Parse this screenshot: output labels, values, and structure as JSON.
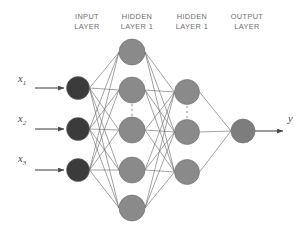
{
  "diagram": {
    "type": "neural-network-architecture",
    "background_color": "#ffffff",
    "layer_titles": [
      {
        "id": "input",
        "text": "INPUT\nLAYER",
        "x": 60,
        "y": 12,
        "width": 54
      },
      {
        "id": "hidden1",
        "text": "HIDDEN\nLAYER 1",
        "x": 108,
        "y": 12,
        "width": 58
      },
      {
        "id": "hidden2",
        "text": "HIDDEN\nLAYER 1",
        "x": 163,
        "y": 12,
        "width": 58
      },
      {
        "id": "output",
        "text": "OUTPUT\nLAYER",
        "x": 218,
        "y": 12,
        "width": 58
      }
    ],
    "input_labels": [
      {
        "base": "x",
        "sub": "1",
        "x": 18,
        "y": 80
      },
      {
        "base": "x",
        "sub": "2",
        "x": 18,
        "y": 120
      },
      {
        "base": "x",
        "sub": "3",
        "x": 18,
        "y": 160
      }
    ],
    "output_label": {
      "base": "y",
      "sub": "",
      "x": 288,
      "y": 120
    },
    "colors": {
      "input_node": "#3b3b3b",
      "hidden_node": "#8a8a8a",
      "output_node": "#7d7d7d",
      "node_stroke": "#6d6d6d",
      "connection": "#6a6a6a",
      "arrow": "#4a4a4a",
      "title_text": "#6f6f6f",
      "ellipsis": "#c9c9c9"
    },
    "layers": [
      {
        "id": "input-layer",
        "name": "input",
        "cx": 78,
        "radius": 11.5,
        "fill": "#3b3b3b",
        "nodes": [
          {
            "id": "i1",
            "cy": 88
          },
          {
            "id": "i2",
            "cy": 129
          },
          {
            "id": "i3",
            "cy": 170
          }
        ],
        "ellipsis": null
      },
      {
        "id": "hidden-layer-1",
        "name": "hidden1",
        "cx": 132,
        "radius": 13,
        "fill": "#8a8a8a",
        "nodes": [
          {
            "id": "h1a",
            "cy": 52
          },
          {
            "id": "h1b",
            "cy": 90
          },
          {
            "id": "h1c",
            "cy": 130
          },
          {
            "id": "h1d",
            "cy": 170
          },
          {
            "id": "h1e",
            "cy": 208
          }
        ],
        "ellipsis": {
          "cx": 132,
          "cy": 110,
          "dots": 3
        }
      },
      {
        "id": "hidden-layer-2",
        "name": "hidden2",
        "cx": 187,
        "radius": 12.5,
        "fill": "#8a8a8a",
        "nodes": [
          {
            "id": "h2a",
            "cy": 92
          },
          {
            "id": "h2b",
            "cy": 132
          },
          {
            "id": "h2c",
            "cy": 172
          }
        ],
        "ellipsis": {
          "cx": 187,
          "cy": 112,
          "dots": 3
        }
      },
      {
        "id": "output-layer",
        "name": "output",
        "cx": 243,
        "radius": 12,
        "fill": "#7d7d7d",
        "nodes": [
          {
            "id": "o1",
            "cy": 131
          }
        ],
        "ellipsis": null
      }
    ],
    "input_arrows": [
      {
        "id": "in-arrow-1",
        "x1": 35,
        "y1": 88,
        "x2": 64,
        "y2": 88
      },
      {
        "id": "in-arrow-2",
        "x1": 35,
        "y1": 129,
        "x2": 64,
        "y2": 129
      },
      {
        "id": "in-arrow-3",
        "x1": 35,
        "y1": 170,
        "x2": 64,
        "y2": 170
      }
    ],
    "output_arrow": {
      "id": "out-arrow",
      "x1": 255,
      "y1": 131,
      "x2": 283,
      "y2": 131
    }
  }
}
